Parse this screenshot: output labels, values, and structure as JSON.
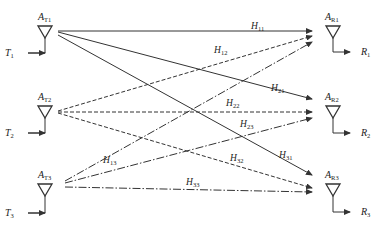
{
  "colors": {
    "line": "#333333",
    "background": "#ffffff"
  },
  "transmitters": [
    {
      "antenna_label": "A",
      "antenna_sub": "T1",
      "input_label": "T",
      "input_sub": "1"
    },
    {
      "antenna_label": "A",
      "antenna_sub": "T2",
      "input_label": "T",
      "input_sub": "2"
    },
    {
      "antenna_label": "A",
      "antenna_sub": "T3",
      "input_label": "T",
      "input_sub": "3"
    }
  ],
  "receivers": [
    {
      "antenna_label": "A",
      "antenna_sub": "R1",
      "output_label": "R",
      "output_sub": "1"
    },
    {
      "antenna_label": "A",
      "antenna_sub": "R2",
      "output_label": "R",
      "output_sub": "2"
    },
    {
      "antenna_label": "A",
      "antenna_sub": "R3",
      "output_label": "R",
      "output_sub": "3"
    }
  ],
  "channels": [
    {
      "label": "H",
      "sub": "11",
      "from": "T1",
      "to": "R1",
      "style": "solid"
    },
    {
      "label": "H",
      "sub": "12",
      "from": "T2",
      "to": "R1",
      "style": "dashed"
    },
    {
      "label": "H",
      "sub": "13",
      "from": "T3",
      "to": "R1",
      "style": "dash-dot"
    },
    {
      "label": "H",
      "sub": "21",
      "from": "T1",
      "to": "R2",
      "style": "solid"
    },
    {
      "label": "H",
      "sub": "22",
      "from": "T2",
      "to": "R2",
      "style": "dashed"
    },
    {
      "label": "H",
      "sub": "23",
      "from": "T3",
      "to": "R2",
      "style": "dash-dot"
    },
    {
      "label": "H",
      "sub": "31",
      "from": "T1",
      "to": "R3",
      "style": "solid"
    },
    {
      "label": "H",
      "sub": "32",
      "from": "T2",
      "to": "R3",
      "style": "dashed"
    },
    {
      "label": "H",
      "sub": "33",
      "from": "T3",
      "to": "R3",
      "style": "dash-dot"
    }
  ]
}
